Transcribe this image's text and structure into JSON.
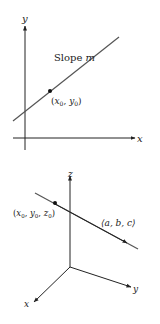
{
  "diagram_2d": {
    "axis_x_label": "x",
    "axis_y_label": "y",
    "slope_label": "Slope",
    "slope_var": "m",
    "point_label_x": "x",
    "point_label_y": "y",
    "point_sub": "0"
  },
  "diagram_3d": {
    "axis_x_label": "x",
    "axis_y_label": "y",
    "axis_z_label": "z",
    "point_label": "(x0, y0, z0)",
    "vector_label": "⟨a, b, c⟩",
    "sub": "0"
  },
  "colors": {
    "ink": "#222222",
    "line": "#555555"
  }
}
